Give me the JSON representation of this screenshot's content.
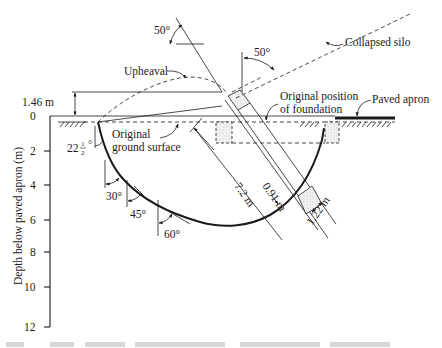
{
  "figure": {
    "type": "geotechnical-cross-section"
  },
  "axis": {
    "label": "Depth below paved apron (m)",
    "ticks": [
      "0",
      "2",
      "4",
      "6",
      "8",
      "10",
      "12"
    ]
  },
  "labels": {
    "collapsed_silo": "Collapsed silo",
    "upheaval": "Upheaval",
    "original_position_line1": "Original position",
    "original_position_line2": "of foundation",
    "paved_apron": "Paved apron",
    "original_ground_line1": "Original",
    "original_ground_line2": "ground surface"
  },
  "dimensions": {
    "upheaval_height": "1.46 m",
    "silo_length": "7.2 m",
    "foundation_depth": "0.91 m",
    "foundation_width": "1.22 m"
  },
  "angles": {
    "silo_tilt_left": "50°",
    "silo_tilt_right": "50°",
    "surface_angle_whole": "22",
    "surface_angle_num": "1",
    "surface_angle_den": "2",
    "surface_angle_deg": "°",
    "angle_30": "30°",
    "angle_45": "45°",
    "angle_60": "60°"
  }
}
